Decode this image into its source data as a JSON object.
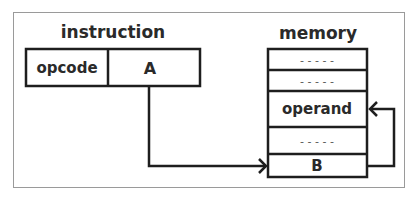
{
  "diagram": {
    "type": "indirect-addressing",
    "instruction": {
      "title": "instruction",
      "fields": [
        {
          "label": "opcode"
        },
        {
          "label": "A"
        }
      ]
    },
    "memory": {
      "title": "memory",
      "cells": [
        {
          "label": "- - - - -",
          "kind": "placeholder"
        },
        {
          "label": "- - - - -",
          "kind": "placeholder"
        },
        {
          "label": "operand",
          "kind": "value"
        },
        {
          "label": "- - - - -",
          "kind": "placeholder"
        },
        {
          "label": "B",
          "kind": "pointer"
        }
      ]
    },
    "arrows": [
      {
        "from": "A",
        "to": "B"
      },
      {
        "from": "B",
        "to": "operand"
      }
    ],
    "colors": {
      "stroke": "#1e1e1e",
      "frame": "#9a9a9a",
      "text": "#2a2a2a",
      "placeholder": "#555555",
      "background": "#ffffff"
    }
  }
}
